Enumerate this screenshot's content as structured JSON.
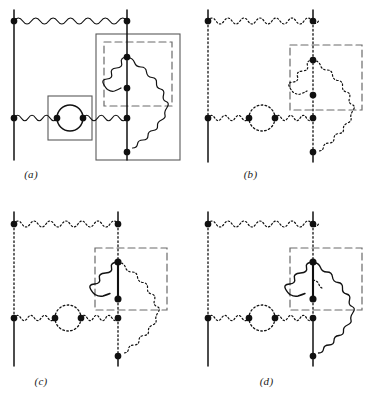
{
  "figure": {
    "type": "feynman-diagram-set",
    "panel_count": 4,
    "width": 371,
    "height": 405,
    "background": "#ffffff",
    "ink_color": "#111111",
    "box_color": "#4a4a4a"
  },
  "panels": [
    {
      "id": "a",
      "caption": "(a)",
      "boxes": [
        {
          "name": "vacuum-polarization-box",
          "style": "solid"
        },
        {
          "name": "outer-vertex-box",
          "style": "solid"
        },
        {
          "name": "inner-self-energy-box",
          "style": "dashed"
        }
      ],
      "line_styles": {
        "fermion_left": "solid",
        "fermion_right": "solid",
        "photon_top": "solid",
        "photon_bottom": "solid",
        "bubble": "solid",
        "inner_photon_loop": "solid",
        "outer_photon_arc": "solid"
      },
      "vertex_count": 9
    },
    {
      "id": "b",
      "caption": "(b)",
      "boxes": [
        {
          "name": "inner-self-energy-box",
          "style": "dashed"
        }
      ],
      "line_styles": {
        "fermion_left": "solid-outside-dotted-inside",
        "fermion_right": "solid-outside-dotted-inside",
        "photon_top": "dotted",
        "photon_bottom": "dotted",
        "bubble": "dotted",
        "inner_photon_loop": "dotted",
        "outer_photon_arc": "dotted"
      },
      "vertex_count": 9
    },
    {
      "id": "c",
      "caption": "(c)",
      "boxes": [
        {
          "name": "inner-self-energy-box",
          "style": "dashed"
        }
      ],
      "line_styles": {
        "fermion_left": "solid-outside-dotted-inside",
        "fermion_right": "solid-outside-dotted-inside",
        "photon_top": "dotted",
        "photon_bottom": "dotted",
        "bubble": "dotted",
        "inner_photon_loop": "solid",
        "inner_fermion_segment": "solid",
        "outer_photon_arc": "dotted"
      },
      "vertex_count": 9
    },
    {
      "id": "d",
      "caption": "(d)",
      "boxes": [
        {
          "name": "inner-self-energy-box",
          "style": "dashed"
        }
      ],
      "line_styles": {
        "fermion_left": "solid-outside-dotted-inside",
        "fermion_right": "solid-outside-dotted-inside",
        "photon_top": "dotted",
        "photon_bottom": "dotted",
        "bubble": "dotted",
        "inner_photon_loop": "solid",
        "inner_fermion_segment": "solid",
        "outer_photon_arc": "solid"
      },
      "vertex_count": 9
    }
  ]
}
